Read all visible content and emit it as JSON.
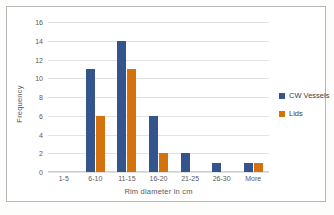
{
  "chart_data": {
    "type": "bar",
    "title": "",
    "xlabel": "Rim diameter in cm",
    "ylabel": "Frequency",
    "categories": [
      "1-5",
      "6-10",
      "11-15",
      "16-20",
      "21-25",
      "26-30",
      "More"
    ],
    "series": [
      {
        "name": "CW Vessels",
        "color": "#34558b",
        "values": [
          0,
          11,
          14,
          6,
          2,
          1,
          1
        ]
      },
      {
        "name": "Lids",
        "color": "#d4720e",
        "values": [
          0,
          6,
          11,
          2,
          0,
          0,
          1
        ]
      }
    ],
    "ylim": [
      0,
      16
    ],
    "ytick_values": [
      0,
      2,
      4,
      6,
      8,
      10,
      12,
      14,
      16
    ],
    "ytick_labels": [
      "0",
      "2",
      "4",
      "6",
      "8",
      "10",
      "12",
      "14",
      "16"
    ],
    "grid": "horizontal",
    "legend_position": "right"
  },
  "legend": {
    "items": [
      {
        "label": "CW Vessels"
      },
      {
        "label": "Lids"
      }
    ]
  },
  "axes": {
    "y_title": "Frequency",
    "x_title": "Rim diameter in cm"
  },
  "colors": {
    "series_cw_vessels": "#34558b",
    "series_lids": "#d4720e",
    "gridline": "#e2e2e2",
    "axis_text": "#595959",
    "chart_border": "#b6b6b6",
    "plot_background": "#ffffff",
    "page_background": "#fdfdfc"
  }
}
